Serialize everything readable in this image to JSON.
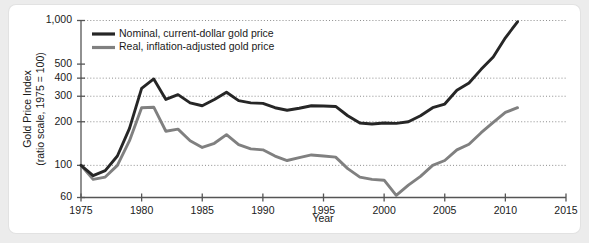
{
  "chart_data": {
    "type": "line",
    "title": "",
    "xlabel": "Year",
    "ylabel": "Gold Price Index\n(ratio scale, 1975 = 100)",
    "ylabel_line1": "Gold Price Index",
    "ylabel_line2": "(ratio scale, 1975 = 100)",
    "yscale": "log",
    "ylim": [
      60,
      1000
    ],
    "xlim": [
      1975,
      2015
    ],
    "yticks": [
      60,
      100,
      200,
      300,
      400,
      500,
      1000
    ],
    "ytick_labels": [
      "60",
      "100",
      "200",
      "300",
      "400",
      "500",
      "1,000"
    ],
    "gridlines_at": [
      100,
      200,
      300,
      400,
      1000
    ],
    "grid": true,
    "xticks": [
      1975,
      1980,
      1985,
      1990,
      1995,
      2000,
      2005,
      2010,
      2015
    ],
    "xtick_labels": [
      "1975",
      "1980",
      "1985",
      "1990",
      "1995",
      "2000",
      "2005",
      "2010",
      "2015"
    ],
    "legend_position": "top-left-inside",
    "x": [
      1975,
      1976,
      1977,
      1978,
      1979,
      1980,
      1981,
      1982,
      1983,
      1984,
      1985,
      1986,
      1987,
      1988,
      1989,
      1990,
      1991,
      1992,
      1993,
      1994,
      1995,
      1996,
      1997,
      1998,
      1999,
      2000,
      2001,
      2002,
      2003,
      2004,
      2005,
      2006,
      2007,
      2008,
      2009,
      2010,
      2011
    ],
    "series": [
      {
        "name": "Nominal, current-dollar gold price",
        "color": "#262626",
        "values": [
          100,
          85,
          92,
          116,
          180,
          340,
          395,
          285,
          308,
          270,
          258,
          285,
          320,
          280,
          270,
          268,
          250,
          240,
          248,
          258,
          257,
          255,
          220,
          196,
          193,
          196,
          195,
          200,
          220,
          250,
          265,
          330,
          370,
          460,
          560,
          760,
          980
        ]
      },
      {
        "name": "Real, inflation-adjusted gold price",
        "color": "#808080",
        "values": [
          100,
          80,
          83,
          100,
          148,
          250,
          252,
          172,
          178,
          148,
          133,
          142,
          163,
          139,
          130,
          128,
          116,
          108,
          113,
          118,
          116,
          114,
          95,
          83,
          80,
          79,
          62,
          73,
          84,
          100,
          108,
          128,
          140,
          168,
          198,
          232,
          250
        ]
      }
    ]
  },
  "legend": {
    "entries": [
      {
        "label": "Nominal, current-dollar gold price",
        "color": "#262626"
      },
      {
        "label": "Real, inflation-adjusted gold price",
        "color": "#808080"
      }
    ]
  },
  "axes": {
    "y_title_line1": "Gold Price Index",
    "y_title_line2": "(ratio scale, 1975 = 100)",
    "x_title": "Year"
  }
}
